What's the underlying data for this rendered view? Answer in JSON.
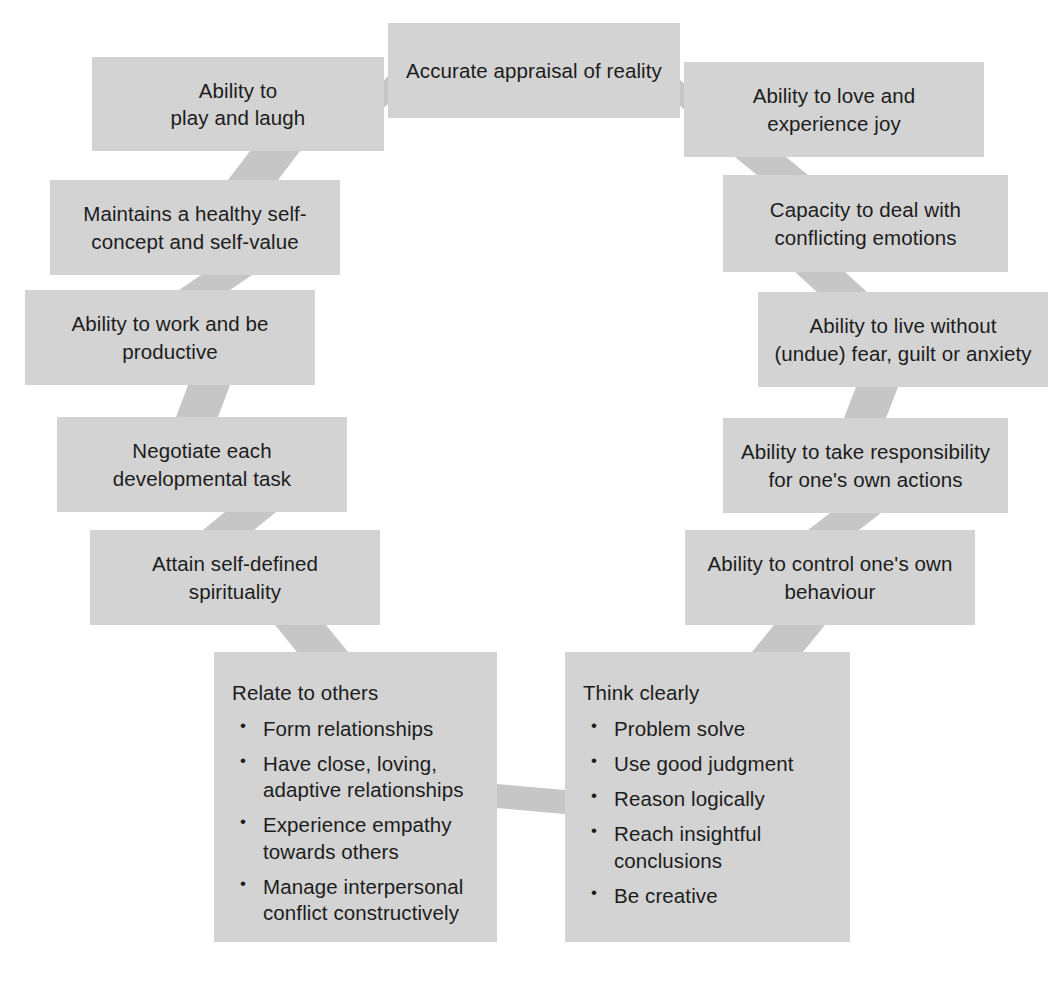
{
  "diagram": {
    "palette": {
      "box_fill": "#d3d3d3",
      "connector_fill": "#c6c6c6",
      "text": "#1c1c1c",
      "background": "#ffffff"
    },
    "nodes": [
      {
        "id": "accurate-appraisal",
        "label": "Accurate appraisal of reality",
        "x": 388,
        "y": 23,
        "w": 292,
        "h": 95
      },
      {
        "id": "play-and-laugh",
        "label": "Ability to\nplay and laugh",
        "x": 92,
        "y": 57,
        "w": 292,
        "h": 94
      },
      {
        "id": "love-and-joy",
        "label": "Ability to love and\nexperience joy",
        "x": 684,
        "y": 62,
        "w": 300,
        "h": 95
      },
      {
        "id": "healthy-self-concept",
        "label": "Maintains a healthy self-\nconcept and self-value",
        "x": 50,
        "y": 180,
        "w": 290,
        "h": 95
      },
      {
        "id": "conflicting-emotions",
        "label": "Capacity to deal with\nconflicting emotions",
        "x": 723,
        "y": 175,
        "w": 285,
        "h": 97
      },
      {
        "id": "work-and-productive",
        "label": "Ability to work and be\nproductive",
        "x": 25,
        "y": 290,
        "w": 290,
        "h": 95
      },
      {
        "id": "live-without-fear",
        "label": "Ability to live without\n(undue) fear, guilt or anxiety",
        "x": 758,
        "y": 292,
        "w": 290,
        "h": 95
      },
      {
        "id": "developmental-task",
        "label": "Negotiate each\ndevelopmental task",
        "x": 57,
        "y": 417,
        "w": 290,
        "h": 95
      },
      {
        "id": "take-responsibility",
        "label": "Ability to take responsibility\nfor one's own actions",
        "x": 723,
        "y": 418,
        "w": 285,
        "h": 95
      },
      {
        "id": "self-defined-spirituality",
        "label": "Attain self-defined\nspirituality",
        "x": 90,
        "y": 530,
        "w": 290,
        "h": 95
      },
      {
        "id": "control-own-behaviour",
        "label": "Ability to control one's own\nbehaviour",
        "x": 685,
        "y": 530,
        "w": 290,
        "h": 95
      }
    ],
    "list_nodes": [
      {
        "id": "relate-to-others",
        "title": "Relate to others",
        "x": 214,
        "y": 652,
        "w": 283,
        "h": 290,
        "items": [
          "Form relationships",
          "Have close, loving,\nadaptive relationships",
          "Experience empathy\ntowards others",
          "Manage interpersonal\nconflict constructively"
        ]
      },
      {
        "id": "think-clearly",
        "title": "Think clearly",
        "x": 565,
        "y": 652,
        "w": 285,
        "h": 290,
        "items": [
          "Problem solve",
          "Use good judgment",
          "Reason logically",
          "Reach insightful\nconclusions",
          "Be creative"
        ]
      }
    ],
    "connectors": [
      {
        "id": "play-to-appraisal",
        "points": "362,104 388,76 388,104 362,128"
      },
      {
        "id": "appraisal-to-love",
        "points": "680,80 706,103 706,128 680,106"
      },
      {
        "id": "play-to-self-concept",
        "points": "250,151 300,151 278,180 228,180"
      },
      {
        "id": "love-to-emotions",
        "points": "735,157 786,157 808,175 757,175"
      },
      {
        "id": "self-concept-to-work",
        "points": "201,275 252,275 230,290 179,290"
      },
      {
        "id": "emotions-to-live-without",
        "points": "795,272 845,272 867,292 817,292"
      },
      {
        "id": "work-to-developmental",
        "points": "188,385 230,385 218,417 176,417"
      },
      {
        "id": "live-to-responsibility",
        "points": "856,387 898,387 886,418 844,418"
      },
      {
        "id": "developmental-to-spirit",
        "points": "225,512 276,512 254,530 203,530"
      },
      {
        "id": "responsibility-to-control",
        "points": "830,513 881,513 859,530 808,530"
      },
      {
        "id": "spirit-to-relate",
        "points": "275,625 326,625 348,652 297,652"
      },
      {
        "id": "control-to-think",
        "points": "774,625 825,625 803,652 752,652"
      },
      {
        "id": "relate-to-think",
        "points": "497,784 565,790 565,814 497,808"
      }
    ]
  }
}
